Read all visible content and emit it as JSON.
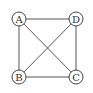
{
  "graph": {
    "nodes": [
      {
        "id": "A",
        "label": "A"
      },
      {
        "id": "B",
        "label": "B"
      },
      {
        "id": "C",
        "label": "C"
      },
      {
        "id": "D",
        "label": "D"
      }
    ],
    "edges": [
      [
        "A",
        "D"
      ],
      [
        "A",
        "B"
      ],
      [
        "A",
        "C"
      ],
      [
        "D",
        "B"
      ],
      [
        "D",
        "C"
      ],
      [
        "B",
        "C"
      ]
    ]
  }
}
